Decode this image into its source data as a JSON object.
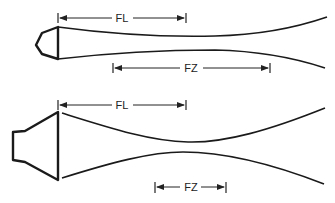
{
  "diagrams": [
    {
      "name": "narrow-focus-transducer",
      "focal_length_label": "FL",
      "focal_zone_label": "FZ"
    },
    {
      "name": "wide-focus-transducer",
      "focal_length_label": "FL",
      "focal_zone_label": "FZ"
    }
  ]
}
